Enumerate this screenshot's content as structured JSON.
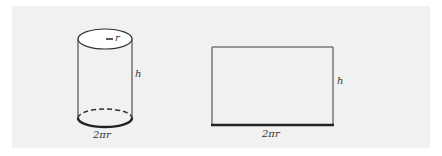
{
  "figure": {
    "cylinder": {
      "radius_label": "r",
      "height_label": "h",
      "circumference_label": "2πr"
    },
    "rectangle": {
      "height_label": "h",
      "width_label": "2πr"
    },
    "colors": {
      "panel_background": "#f1f1f1",
      "stroke": "#333333",
      "rect_stroke": "#666666"
    }
  }
}
